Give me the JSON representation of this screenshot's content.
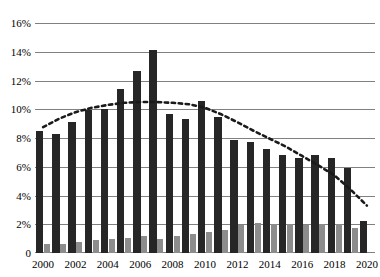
{
  "chart_data": {
    "type": "bar",
    "title": "",
    "subtitle": "",
    "xlabel": "",
    "ylabel": "",
    "ylim": [
      0,
      16
    ],
    "ytick_values": [
      0,
      2,
      4,
      6,
      8,
      10,
      12,
      14,
      16
    ],
    "ytick_labels": [
      "0",
      "2%",
      "4%",
      "6%",
      "8%",
      "10%",
      "12%",
      "14%",
      "16%"
    ],
    "grid": true,
    "legend": "none",
    "categories": [
      "2000",
      "2001",
      "2002",
      "2003",
      "2004",
      "2005",
      "2006",
      "2007",
      "2008",
      "2009",
      "2010",
      "2011",
      "2012",
      "2013",
      "2014",
      "2015",
      "2016",
      "2017",
      "2018",
      "2019",
      "2020"
    ],
    "xtick_labels": [
      "2000",
      "",
      "2002",
      "",
      "2004",
      "",
      "2006",
      "",
      "2008",
      "",
      "2010",
      "",
      "2012",
      "",
      "2014",
      "",
      "2016",
      "",
      "2018",
      "",
      "2020"
    ],
    "series": [
      {
        "name": "dark-series",
        "color": "#262626",
        "values": [
          8.5,
          8.3,
          9.1,
          9.95,
          10.0,
          11.4,
          12.65,
          14.15,
          9.65,
          9.35,
          10.55,
          9.45,
          7.85,
          7.75,
          7.25,
          6.8,
          6.6,
          6.8,
          6.6,
          5.9,
          2.2
        ]
      },
      {
        "name": "gray-series",
        "color": "#8c8c8c",
        "values": [
          0.6,
          0.65,
          0.75,
          0.9,
          0.95,
          1.05,
          1.15,
          1.0,
          1.2,
          1.3,
          1.45,
          1.6,
          1.95,
          2.1,
          2.0,
          2.0,
          1.95,
          2.05,
          2.0,
          1.75,
          0.0
        ]
      }
    ],
    "trendline": {
      "name": "polynomial-trendline",
      "style": "dotted",
      "color": "#1a1a1a",
      "values": [
        8.75,
        9.35,
        9.8,
        10.1,
        10.3,
        10.45,
        10.5,
        10.5,
        10.45,
        10.35,
        10.1,
        9.65,
        9.1,
        8.5,
        7.95,
        7.4,
        6.75,
        6.1,
        5.4,
        4.4,
        3.3
      ]
    }
  }
}
